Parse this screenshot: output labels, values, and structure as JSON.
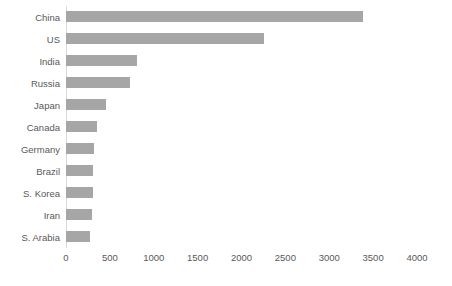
{
  "chart_data": {
    "type": "bar",
    "orientation": "horizontal",
    "title": "",
    "subtitle": "",
    "xlabel": "",
    "ylabel": "",
    "categories": [
      "China",
      "US",
      "India",
      "Russia",
      "Japan",
      "Canada",
      "Germany",
      "Brazil",
      "S. Korea",
      "Iran",
      "S. Arabia"
    ],
    "values": [
      3380,
      2255,
      810,
      730,
      455,
      350,
      320,
      310,
      305,
      300,
      270
    ],
    "xlim": [
      0,
      4000
    ],
    "xticks": [
      0,
      500,
      1000,
      1500,
      2000,
      2500,
      3000,
      3500,
      4000
    ],
    "xtick_labels": [
      "0",
      "500",
      "1000",
      "1500",
      "2000",
      "2500",
      "3000",
      "3500",
      "4000"
    ],
    "grid": false,
    "legend": null,
    "bar_color": "#a6a6a6",
    "axis_color": "#d9d9d9",
    "label_color": "#595959"
  }
}
